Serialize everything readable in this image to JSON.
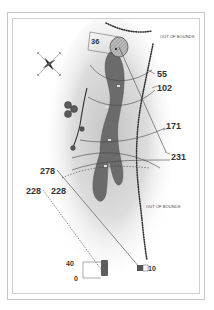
{
  "diagram": {
    "type": "golf-hole-yardage-map",
    "labels": {
      "out_of_bounds_top": "OUT OF BOUNDS",
      "out_of_bounds_right": "OUT OF BOUNDS"
    },
    "distances": {
      "green_depth": "36",
      "d55": "55",
      "d102": "102",
      "d171": "171",
      "d231": "231",
      "d278": "278",
      "d228_left": "228",
      "d228_inner": "228",
      "tee_40": "40",
      "tee_0": "0",
      "tee_10": "10"
    },
    "icons": [
      "compass-rose-icon",
      "tree-cluster-icon",
      "tree-icon",
      "green-flag-icon"
    ],
    "colors": {
      "fairway": "#6e6e6e",
      "rough_shade": "#d9d9d9",
      "green": "#9a9a9a",
      "lines": "#444444",
      "text": "#333333",
      "frame": "#c8c8c8"
    }
  }
}
